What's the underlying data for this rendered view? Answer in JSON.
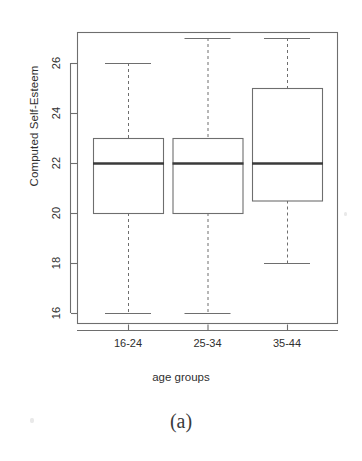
{
  "figure": {
    "caption": "(a)",
    "background_color": "#ffffff",
    "ink_color": "#3a3a3a"
  },
  "chart_data": {
    "type": "box",
    "title": "",
    "subtitle": "",
    "xlabel": "age groups",
    "ylabel": "Computed Self-Esteem",
    "categories": [
      "16-24",
      "25-34",
      "35-44"
    ],
    "ylim": [
      15.6,
      27.6
    ],
    "yticks": [
      16,
      18,
      20,
      22,
      24,
      26
    ],
    "ytick_labels": [
      "16",
      "18",
      "20",
      "22",
      "24",
      "26"
    ],
    "grid": false,
    "legend": null,
    "boxes": [
      {
        "category": "16-24",
        "whisker_low": 16,
        "q1": 20,
        "median": 22,
        "q3": 23,
        "whisker_high": 26,
        "outliers": []
      },
      {
        "category": "25-34",
        "whisker_low": 16,
        "q1": 20,
        "median": 22,
        "q3": 23,
        "whisker_high": 27,
        "outliers": []
      },
      {
        "category": "35-44",
        "whisker_low": 18,
        "q1": 20.5,
        "median": 22,
        "q3": 25,
        "whisker_high": 27,
        "outliers": []
      }
    ]
  },
  "geometry": {
    "plot_left": 77,
    "plot_right": 337,
    "plot_top": 32,
    "plot_bottom": 323,
    "y_at_16": 313,
    "px_per_unit": 25,
    "box_centers": [
      128,
      207.5,
      287
    ],
    "box_half_width": 35
  }
}
